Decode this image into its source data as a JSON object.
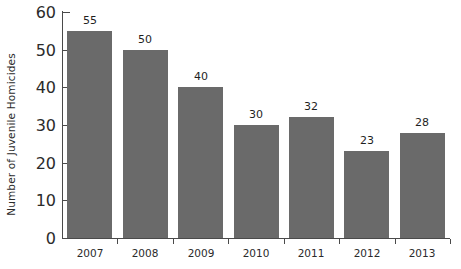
{
  "chart_data": {
    "type": "bar",
    "title": "",
    "subtitle": "",
    "xlabel": "",
    "ylabel": "Number of Juvenile Homicides",
    "categories": [
      "2007",
      "2008",
      "2009",
      "2010",
      "2011",
      "2012",
      "2013"
    ],
    "values": [
      55,
      50,
      40,
      30,
      32,
      23,
      28
    ],
    "data_labels": [
      "55",
      "50",
      "40",
      "30",
      "32",
      "23",
      "28"
    ],
    "ylim": [
      0,
      60
    ],
    "y_ticks": [
      0,
      10,
      20,
      30,
      40,
      50,
      60
    ],
    "y_tick_labels": [
      "0",
      "10",
      "20",
      "30",
      "40",
      "50",
      "60"
    ],
    "grid": false,
    "legend": false,
    "legend_position": "none",
    "series": [
      {
        "name": "Juvenile Homicides",
        "values": [
          55,
          50,
          40,
          30,
          32,
          23,
          28
        ]
      }
    ],
    "colors": {
      "bar_fill": "#6a6a6a",
      "axis": "#4a4a4a",
      "text": "#2b2b2b",
      "background": "#ffffff"
    }
  }
}
